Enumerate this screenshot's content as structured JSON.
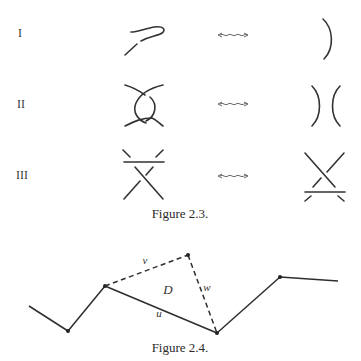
{
  "figure_2_3": {
    "caption": "Figure 2.3.",
    "moves": [
      {
        "label": "I",
        "left": "kink-loop",
        "relation": "wavy-double-arrow",
        "right": "single-arc"
      },
      {
        "label": "II",
        "left": "two-crossings-bigon",
        "relation": "wavy-double-arrow",
        "right": "two-separate-arcs"
      },
      {
        "label": "III",
        "left": "strand-over-crossing-top",
        "relation": "wavy-double-arrow",
        "right": "strand-over-crossing-bottom"
      }
    ]
  },
  "figure_2_4": {
    "caption": "Figure 2.4.",
    "labels": {
      "v": "v",
      "w": "w",
      "u": "u",
      "D": "D"
    }
  },
  "colors": {
    "ink": "#2e2e2e",
    "background": "#ffffff"
  }
}
